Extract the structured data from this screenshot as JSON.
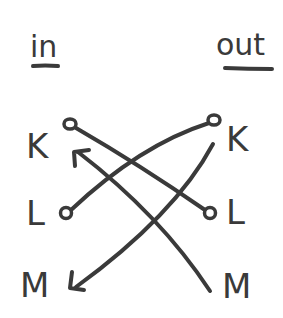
{
  "diagram": {
    "headers": {
      "left": "in",
      "right": "out"
    },
    "left_nodes": [
      {
        "label": "K",
        "terminal": "circle"
      },
      {
        "label": "L",
        "terminal": "circle"
      },
      {
        "label": "M",
        "terminal": "arrowhead"
      }
    ],
    "right_nodes": [
      {
        "label": "K",
        "terminal": "circle"
      },
      {
        "label": "L",
        "terminal": "circle"
      },
      {
        "label": "M",
        "terminal": "line-end"
      }
    ],
    "edges": [
      {
        "from": "in.K",
        "to": "out.L",
        "style": "circle-to-circle"
      },
      {
        "from": "in.L",
        "to": "out.K",
        "style": "circle-to-circle"
      },
      {
        "from": "out.K",
        "to": "in.M",
        "style": "arrow"
      },
      {
        "from": "out.M",
        "to": "in.K",
        "style": "arrow"
      }
    ],
    "colors": {
      "ink": "#3a3a3a",
      "background": "#ffffff"
    }
  }
}
